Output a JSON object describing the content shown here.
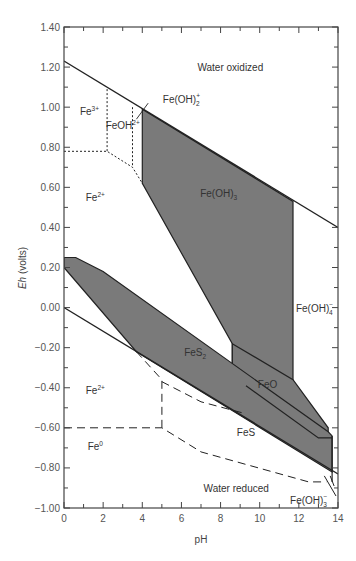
{
  "chart_data": {
    "type": "phase-diagram",
    "title": "",
    "xlabel": "pH",
    "ylabel_italic": "Eh",
    "ylabel_rest": " (volts)",
    "xlim": [
      0,
      14
    ],
    "ylim": [
      -1.0,
      1.4
    ],
    "xticks": [
      0,
      2,
      4,
      6,
      8,
      10,
      12,
      14
    ],
    "xtick_labels": [
      "0",
      "2",
      "4",
      "6",
      "8",
      "10",
      "12",
      "14"
    ],
    "yticks": [
      1.4,
      1.2,
      1.0,
      0.8,
      0.6,
      0.4,
      0.2,
      0.0,
      -0.2,
      -0.4,
      -0.6,
      -0.8,
      -1.0
    ],
    "ytick_labels": [
      "1.40",
      "1.20",
      "1.00",
      "0.80",
      "0.60",
      "0.40",
      "0.20",
      "0.00",
      "−0.20",
      "−0.40",
      "−0.60",
      "−0.80",
      "−1.00"
    ],
    "colors": {
      "shaded": "#7a7a7a",
      "line": "#222222",
      "frame": "#444444"
    },
    "water_lines": [
      {
        "name": "upper-water-limit",
        "points": [
          [
            0,
            1.23
          ],
          [
            14,
            0.4
          ]
        ]
      },
      {
        "name": "lower-water-limit",
        "points": [
          [
            0,
            0.0
          ],
          [
            14,
            -0.83
          ]
        ]
      }
    ],
    "shaded_regions": [
      {
        "name": "Fe(OH)3",
        "points": [
          [
            4.0,
            0.99
          ],
          [
            11.7,
            0.53
          ],
          [
            11.7,
            -0.6
          ],
          [
            8.6,
            -0.42
          ],
          [
            8.6,
            -0.18
          ],
          [
            4.0,
            0.62
          ]
        ]
      },
      {
        "name": "FeO",
        "points": [
          [
            8.6,
            -0.18
          ],
          [
            11.7,
            -0.36
          ],
          [
            13.5,
            -0.6
          ],
          [
            13.5,
            -0.65
          ],
          [
            8.6,
            -0.42
          ]
        ]
      },
      {
        "name": "FeS2",
        "points": [
          [
            0,
            0.25
          ],
          [
            0.6,
            0.25
          ],
          [
            2.0,
            0.18
          ],
          [
            13.5,
            -0.62
          ],
          [
            13.7,
            -0.64
          ],
          [
            13.7,
            -0.82
          ],
          [
            3.7,
            -0.22
          ],
          [
            0,
            0.2
          ]
        ]
      }
    ],
    "solid_lines": [
      {
        "name": "fes2-feo-boundary",
        "points": [
          [
            9.3,
            -0.39
          ],
          [
            13.0,
            -0.65
          ],
          [
            13.7,
            -0.65
          ]
        ]
      },
      {
        "name": "fes-lower-edge",
        "points": [
          [
            13.7,
            -0.64
          ],
          [
            13.7,
            -0.87
          ]
        ]
      }
    ],
    "dashed_lines": [
      {
        "name": "fe3-fe2-boundary",
        "points": [
          [
            0,
            0.78
          ],
          [
            2.2,
            0.78
          ],
          [
            3.5,
            0.7
          ],
          [
            4.0,
            0.62
          ]
        ]
      },
      {
        "name": "fe3-feoh-boundary",
        "points": [
          [
            2.2,
            1.09
          ],
          [
            2.2,
            0.78
          ]
        ]
      },
      {
        "name": "feoh-feoh2-boundary",
        "points": [
          [
            3.5,
            1.0
          ],
          [
            3.5,
            0.7
          ]
        ]
      },
      {
        "name": "fe2-fes-boundary",
        "points": [
          [
            3.7,
            -0.22
          ],
          [
            5.0,
            -0.36
          ],
          [
            5.0,
            -0.6
          ]
        ]
      },
      {
        "name": "fes-upper-dashed",
        "points": [
          [
            5.0,
            -0.37
          ],
          [
            7.0,
            -0.47
          ],
          [
            9.3,
            -0.53
          ]
        ]
      },
      {
        "name": "fe0-boundary",
        "points": [
          [
            0,
            -0.6
          ],
          [
            5.0,
            -0.6
          ],
          [
            7.0,
            -0.72
          ],
          [
            12.5,
            -0.87
          ],
          [
            13.4,
            -0.87
          ]
        ]
      }
    ],
    "labels": [
      {
        "text": "Water oxidized",
        "pos": [
          8.5,
          1.18
        ]
      },
      {
        "text": "Fe",
        "sup": "3+",
        "pos": [
          1.3,
          0.96
        ]
      },
      {
        "text": "FeOH",
        "sup": "2+",
        "pos": [
          3.0,
          0.89
        ]
      },
      {
        "text": "Fe(OH)",
        "sup": "+",
        "sub": "2",
        "pos": [
          6.0,
          1.02
        ]
      },
      {
        "text": "Fe",
        "sup": "2+",
        "pos": [
          1.6,
          0.53
        ]
      },
      {
        "text": "Fe(OH)",
        "sub": "3",
        "pos": [
          7.9,
          0.55
        ]
      },
      {
        "text": "Fe(OH)",
        "sup": "−",
        "sub": "4",
        "pos": [
          12.8,
          -0.02
        ]
      },
      {
        "text": "FeS",
        "sub": "2",
        "pos": [
          6.7,
          -0.24
        ]
      },
      {
        "text": "FeO",
        "pos": [
          10.4,
          -0.4
        ]
      },
      {
        "text": "Fe",
        "sup": "2+",
        "pos": [
          1.6,
          -0.43
        ]
      },
      {
        "text": "FeS",
        "pos": [
          9.3,
          -0.64
        ]
      },
      {
        "text": "Fe",
        "sup": "0",
        "pos": [
          1.6,
          -0.71
        ]
      },
      {
        "text": "Water reduced",
        "pos": [
          8.8,
          -0.92
        ]
      },
      {
        "text": "Fe(OH)",
        "sup": "−",
        "sub": "3",
        "pos": [
          12.5,
          -0.98
        ]
      }
    ]
  }
}
